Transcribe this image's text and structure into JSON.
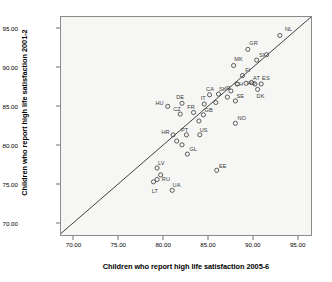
{
  "chart_data": {
    "type": "scatter",
    "title": "",
    "xlabel": "Children who report high life satisfaction 2005-6",
    "ylabel": "Children who report high life satisfaction 2001-2",
    "xlim": [
      68.5,
      96.6
    ],
    "ylim": [
      68.3,
      96.6
    ],
    "xticks": [
      "70.00",
      "75.00",
      "80.00",
      "85.00",
      "90.00",
      "95.00"
    ],
    "yticks": [
      "70.00",
      "75.00",
      "80.00",
      "85.00",
      "90.00",
      "95.00"
    ],
    "xtick_values": [
      70,
      75,
      80,
      85,
      90,
      95
    ],
    "ytick_values": [
      70,
      75,
      80,
      85,
      90,
      95
    ],
    "grid": false,
    "legend": "none",
    "marker": "open-circle",
    "reference_line": {
      "name": "identity-line",
      "type": "y=x",
      "from": [
        68.5,
        68.5
      ],
      "to": [
        96.6,
        96.6
      ]
    },
    "points": [
      {
        "label": "NL",
        "x": 93.1,
        "y": 94.2,
        "lx": 1.0,
        "ly": 1.0
      },
      {
        "label": "GR",
        "x": 89.5,
        "y": 92.4,
        "lx": 0.6,
        "ly": 1.1
      },
      {
        "label": "",
        "x": 91.6,
        "y": 91.7,
        "lx": 0.0,
        "ly": 0.0
      },
      {
        "label": "MK",
        "x": 87.9,
        "y": 90.3,
        "lx": 0.5,
        "ly": 1.1
      },
      {
        "label": "SI",
        "x": 90.5,
        "y": 91.0,
        "lx": 0.5,
        "ly": 0.9
      },
      {
        "label": "FI",
        "x": 88.9,
        "y": 89.0,
        "lx": 0.55,
        "ly": 0.95
      },
      {
        "label": "AT",
        "x": 90.3,
        "y": 87.9,
        "lx": 0.0,
        "ly": 1.1
      },
      {
        "label": "ES",
        "x": 91.0,
        "y": 87.9,
        "lx": 0.45,
        "ly": 1.15
      },
      {
        "label": "CH",
        "x": 89.3,
        "y": 88.0,
        "lx": -1.2,
        "ly": 0.0
      },
      {
        "label": "HO",
        "x": 89.9,
        "y": 88.1,
        "lx": -0.2,
        "ly": 0.0
      },
      {
        "label": "DK",
        "x": 90.6,
        "y": 87.2,
        "lx": 0.2,
        "ly": -1.0
      },
      {
        "label": "",
        "x": 88.3,
        "y": 87.9,
        "lx": 0.0,
        "ly": 0.0
      },
      {
        "label": "IE",
        "x": 87.6,
        "y": 87.0,
        "lx": -0.6,
        "ly": 0.6
      },
      {
        "label": "SE",
        "x": 88.1,
        "y": 85.7,
        "lx": 0.5,
        "ly": 1.0
      },
      {
        "label": "",
        "x": 87.2,
        "y": 86.2,
        "lx": 0.0,
        "ly": 0.0
      },
      {
        "label": "NO",
        "x": 88.1,
        "y": 82.8,
        "lx": 0.7,
        "ly": 1.0
      },
      {
        "label": "CA",
        "x": 85.2,
        "y": 86.5,
        "lx": -0.1,
        "ly": 1.1
      },
      {
        "label": "SK",
        "x": 86.2,
        "y": 86.6,
        "lx": 0.45,
        "ly": 0.9
      },
      {
        "label": "",
        "x": 85.9,
        "y": 85.5,
        "lx": 0.0,
        "ly": 0.0
      },
      {
        "label": "IT",
        "x": 84.6,
        "y": 85.3,
        "lx": -0.3,
        "ly": 1.1
      },
      {
        "label": "DE",
        "x": 82.1,
        "y": 85.4,
        "lx": -0.4,
        "ly": 1.1
      },
      {
        "label": "HU",
        "x": 80.5,
        "y": 85.0,
        "lx": -1.3,
        "ly": 0.7
      },
      {
        "label": "GB",
        "x": 84.5,
        "y": 83.9,
        "lx": 0.6,
        "ly": 0.95
      },
      {
        "label": "FR",
        "x": 83.4,
        "y": 84.2,
        "lx": -0.5,
        "ly": 1.0
      },
      {
        "label": "CZ",
        "x": 81.9,
        "y": 84.0,
        "lx": -0.6,
        "ly": 1.0
      },
      {
        "label": "",
        "x": 84.0,
        "y": 83.1,
        "lx": 0.0,
        "ly": 0.0
      },
      {
        "label": "US",
        "x": 84.1,
        "y": 81.3,
        "lx": 0.4,
        "ly": 1.0
      },
      {
        "label": "PT",
        "x": 82.6,
        "y": 81.3,
        "lx": -0.4,
        "ly": 1.0
      },
      {
        "label": "HR",
        "x": 81.1,
        "y": 81.3,
        "lx": -1.2,
        "ly": 0.7
      },
      {
        "label": "",
        "x": 81.5,
        "y": 80.5,
        "lx": 0.0,
        "ly": 0.0
      },
      {
        "label": "",
        "x": 82.1,
        "y": 80.0,
        "lx": 0.0,
        "ly": 0.0
      },
      {
        "label": "GL",
        "x": 82.7,
        "y": 78.8,
        "lx": 0.7,
        "ly": 1.0
      },
      {
        "label": "EE",
        "x": 86.0,
        "y": 76.7,
        "lx": 0.7,
        "ly": 0.9
      },
      {
        "label": "LV",
        "x": 79.3,
        "y": 77.0,
        "lx": 0.5,
        "ly": 1.0
      },
      {
        "label": "RU",
        "x": 79.7,
        "y": 76.1,
        "lx": 0.65,
        "ly": -0.4
      },
      {
        "label": "",
        "x": 79.3,
        "y": 75.5,
        "lx": 0.0,
        "ly": 0.0
      },
      {
        "label": "LT",
        "x": 78.9,
        "y": 75.2,
        "lx": 0.1,
        "ly": -1.2
      },
      {
        "label": "UA",
        "x": 81.0,
        "y": 74.1,
        "lx": 0.5,
        "ly": 1.1
      }
    ]
  }
}
